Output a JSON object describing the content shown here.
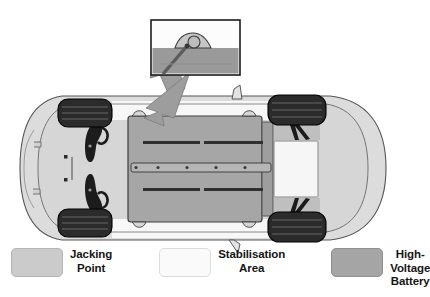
{
  "figure": {
    "background_color": "#ffffff"
  },
  "callout": {
    "name": "jacking-point-detail-inset",
    "description": "Close-up side view of a jacking point lug with jack arm engaged",
    "frame_color": "#1c1c1c",
    "sky_color": "#fcfcfc",
    "ground_color": "#9a9a9a",
    "lug_color": "#c4c4c4",
    "arrow_color": "#8a8a8a",
    "arrow_direction": "down-left"
  },
  "vehicle": {
    "name": "car-underbody-top-view",
    "body_fill": "#dcdcdc",
    "body_outline": "#4a4a4a",
    "underbody_fill": "#d2d2d2",
    "tire_fill": "#2b2b2b",
    "tire_outline": "#000000",
    "suspension_fill": "#1f1f1f",
    "battery_fill": "#a3a3a3",
    "battery_outline": "#3c3c3c",
    "stabilisation_fill": "#f4f4f4",
    "jacking_fill": "#cfcfcf",
    "detail_line_color": "#3a3a3a",
    "wheels": [
      {
        "label": "front-left-wheel"
      },
      {
        "label": "front-right-wheel"
      },
      {
        "label": "rear-left-wheel"
      },
      {
        "label": "rear-right-wheel"
      }
    ],
    "jacking_points": 4,
    "battery_bolt_count": 5
  },
  "legend": {
    "name": "diagram-legend",
    "items": [
      {
        "id": "jacking-point",
        "label": "Jacking\nPoint",
        "swatch_color": "#cbcbcb",
        "swatch_border": "#b4b4b4"
      },
      {
        "id": "stabilisation-area",
        "label": "Stabilisation\nArea",
        "swatch_color": "#fafafa",
        "swatch_border": "#dcdcdc"
      },
      {
        "id": "high-voltage-battery",
        "label": "High-Voltage\nBattery",
        "swatch_color": "#a5a5a5",
        "swatch_border": "#8e8e8e"
      }
    ]
  }
}
